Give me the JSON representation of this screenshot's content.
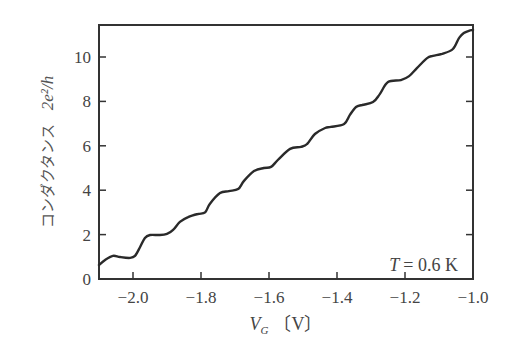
{
  "chart_data": {
    "type": "line",
    "title": "",
    "xlabel": "V_G (V)",
    "xlabel_main": "V",
    "xlabel_sub": "G",
    "xlabel_unit": "〔V〕",
    "ylabel": "コンダクタンス  2e²/h",
    "ylabel_text": "コンダクタンス",
    "ylabel_unit": "2e²/h",
    "xlim": [
      -2.1,
      -1.0
    ],
    "ylim": [
      0,
      11.4
    ],
    "grid": false,
    "legend": null,
    "x_ticks": [
      -2.0,
      -1.8,
      -1.6,
      -1.4,
      -1.2,
      -1.0
    ],
    "x_tick_labels": [
      "−2.0",
      "−1.8",
      "−1.6",
      "−1.4",
      "−1.2",
      "−1.0"
    ],
    "y_ticks": [
      0,
      2,
      4,
      6,
      8,
      10
    ],
    "y_tick_labels": [
      "0",
      "2",
      "4",
      "6",
      "8",
      "10"
    ],
    "annotation": "T = 0.6 K",
    "annotation_var": "T",
    "annotation_rest": "= 0.6 K",
    "series": [
      {
        "name": "conductance",
        "x": [
          -2.1,
          -2.082,
          -2.059,
          -2.038,
          -2.009,
          -1.994,
          -1.979,
          -1.965,
          -1.95,
          -1.921,
          -1.9,
          -1.882,
          -1.862,
          -1.838,
          -1.809,
          -1.788,
          -1.774,
          -1.744,
          -1.718,
          -1.691,
          -1.674,
          -1.644,
          -1.615,
          -1.594,
          -1.574,
          -1.538,
          -1.506,
          -1.488,
          -1.465,
          -1.435,
          -1.418,
          -1.379,
          -1.362,
          -1.344,
          -1.326,
          -1.294,
          -1.274,
          -1.25,
          -1.212,
          -1.188,
          -1.165,
          -1.135,
          -1.118,
          -1.091,
          -1.059,
          -1.041,
          -1.027,
          -1.012,
          -1.0
        ],
        "y": [
          0.63,
          0.86,
          1.04,
          0.99,
          0.95,
          1.04,
          1.44,
          1.85,
          1.98,
          1.98,
          2.03,
          2.21,
          2.57,
          2.79,
          2.93,
          3.0,
          3.38,
          3.87,
          3.96,
          4.05,
          4.41,
          4.86,
          5.0,
          5.05,
          5.36,
          5.86,
          5.95,
          6.08,
          6.53,
          6.8,
          6.85,
          6.98,
          7.39,
          7.75,
          7.84,
          7.97,
          8.33,
          8.87,
          8.96,
          9.14,
          9.5,
          9.95,
          10.05,
          10.14,
          10.36,
          10.86,
          11.08,
          11.18,
          11.22
        ]
      }
    ]
  }
}
